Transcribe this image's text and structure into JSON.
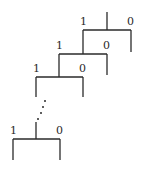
{
  "diagram": {
    "type": "recursive-binary-tree",
    "levels": [
      {
        "left_label": "1",
        "right_label": "0"
      },
      {
        "left_label": "1",
        "right_label": "0"
      },
      {
        "left_label": "1",
        "right_label": "0"
      },
      {
        "left_label": "1",
        "right_label": "0"
      }
    ],
    "ellipsis": "⋮",
    "colors": {
      "stroke": "#2a2a2a",
      "background": "#ffffff"
    }
  }
}
